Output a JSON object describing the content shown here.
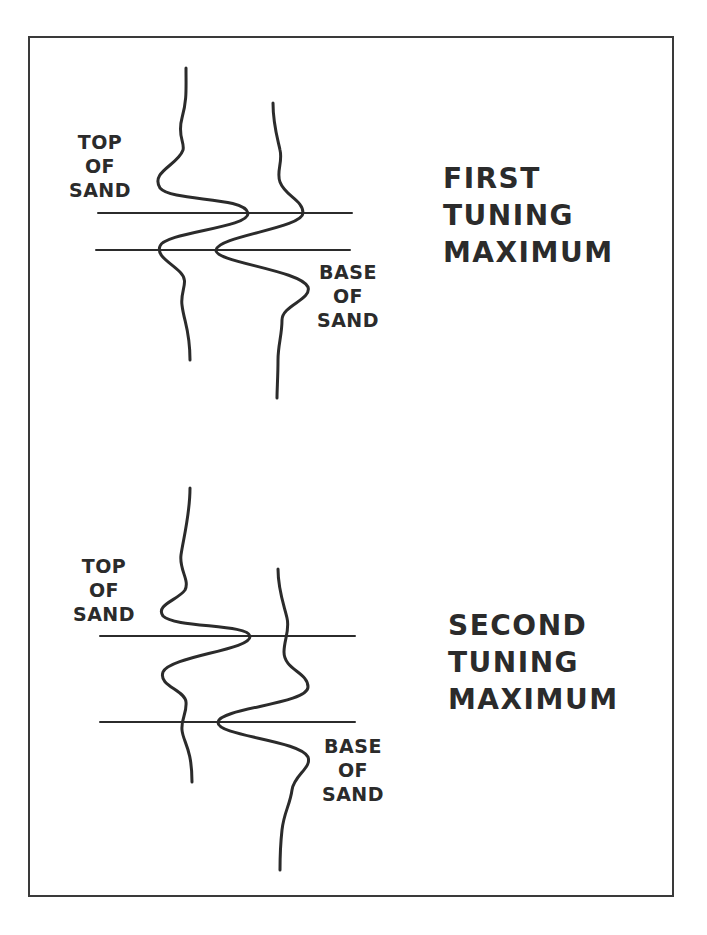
{
  "figure": {
    "panels": [
      {
        "id": "first",
        "title_lines": [
          "FIRST",
          "TUNING",
          "MAXIMUM"
        ],
        "top_label_lines": [
          "TOP",
          "OF",
          "SAND"
        ],
        "base_label_lines": [
          "BASE",
          "OF",
          "SAND"
        ]
      },
      {
        "id": "second",
        "title_lines": [
          "SECOND",
          "TUNING",
          "MAXIMUM"
        ],
        "top_label_lines": [
          "TOP",
          "OF",
          "SAND"
        ],
        "base_label_lines": [
          "BASE",
          "OF",
          "SAND"
        ]
      }
    ],
    "colors": {
      "ink": "#2b2b2b",
      "frame": "#3a3a3a",
      "background": "#ffffff"
    }
  }
}
